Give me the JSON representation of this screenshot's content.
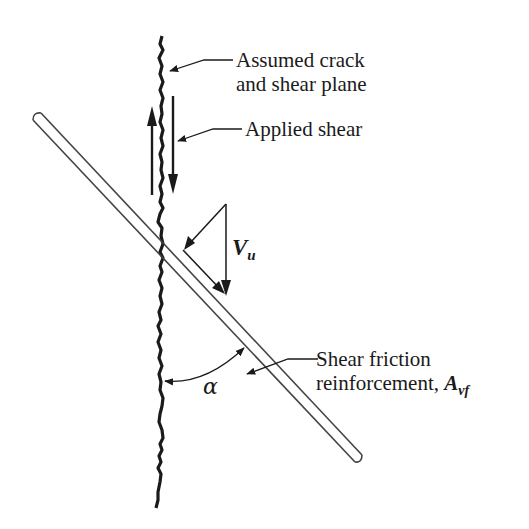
{
  "diagram": {
    "type": "shear-friction-concept",
    "labels": {
      "crack_line1": "Assumed crack",
      "crack_line2": "and shear plane",
      "applied_shear": "Applied shear",
      "force_symbol_base": "V",
      "force_symbol_sub": "u",
      "reinf_line1": "Shear friction",
      "reinf_line2": "reinforcement, ",
      "reinf_symbol_base": "A",
      "reinf_symbol_sub": "vf",
      "angle_symbol": "α"
    },
    "colors": {
      "ink": "#1a1a1a",
      "bar_outline": "#444444",
      "background": "#ffffff"
    }
  }
}
